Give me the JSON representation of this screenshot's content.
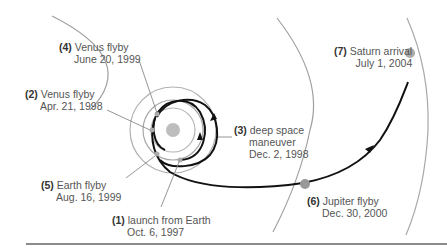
{
  "diagram": {
    "title": "",
    "colors": {
      "trajectory": "#111111",
      "orbit": "#a0a0a0",
      "planet": "#a8a8a8",
      "sun": "#bdbdbd",
      "leader": "#8a8a8a",
      "rule": "#8c8c8c"
    },
    "events": [
      {
        "id": "1",
        "num": "(1)",
        "name": "launch from Earth",
        "date": "Oct. 6, 1997"
      },
      {
        "id": "2",
        "num": "(2)",
        "name": "Venus flyby",
        "date": "Apr. 21, 1998"
      },
      {
        "id": "3",
        "num": "(3)",
        "name": "deep space",
        "name2": "maneuver",
        "date": "Dec. 2, 1998"
      },
      {
        "id": "4",
        "num": "(4)",
        "name": "Venus flyby",
        "date": "June 20, 1999"
      },
      {
        "id": "5",
        "num": "(5)",
        "name": "Earth flyby",
        "date": "Aug. 16, 1999"
      },
      {
        "id": "6",
        "num": "(6)",
        "name": "Jupiter flyby",
        "date": "Dec. 30, 2000"
      },
      {
        "id": "7",
        "num": "(7)",
        "name": "Saturn arrival",
        "date": "July 1, 2004"
      }
    ],
    "bodies": [
      "Sun",
      "Venus orbit",
      "Earth orbit",
      "Mars orbit",
      "Jupiter orbit",
      "Saturn orbit"
    ]
  }
}
